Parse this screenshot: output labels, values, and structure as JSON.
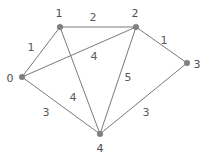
{
  "figure": {
    "name": "weighted-undirected-graph",
    "width": 207,
    "height": 155,
    "background_color": "#ffffff",
    "node_color": "#808080",
    "edge_color": "#7a7a7a",
    "label_color": "#5a5a5a"
  },
  "chart_data": {
    "type": "diagram",
    "subtype": "node-link-graph",
    "title": "",
    "directed": false,
    "weighted": true,
    "node_count": 5,
    "edge_count": 8,
    "nodes": [
      {
        "id": "0",
        "label": "0",
        "x": 22,
        "y": 77,
        "label_x": 10,
        "label_y": 78
      },
      {
        "id": "1",
        "label": "1",
        "x": 60,
        "y": 27,
        "label_x": 59,
        "label_y": 13
      },
      {
        "id": "2",
        "label": "2",
        "x": 136,
        "y": 27,
        "label_x": 135,
        "label_y": 13
      },
      {
        "id": "3",
        "label": "3",
        "x": 187,
        "y": 63,
        "label_x": 197,
        "label_y": 64
      },
      {
        "id": "4",
        "label": "4",
        "x": 100,
        "y": 134,
        "label_x": 100,
        "label_y": 148
      }
    ],
    "edges": [
      {
        "source": "0",
        "target": "1",
        "weight": "1",
        "label_x": 31,
        "label_y": 47
      },
      {
        "source": "1",
        "target": "2",
        "weight": "2",
        "label_x": 93,
        "label_y": 17
      },
      {
        "source": "0",
        "target": "2",
        "weight": "4",
        "label_x": 94,
        "label_y": 56
      },
      {
        "source": "2",
        "target": "3",
        "weight": "1",
        "label_x": 164,
        "label_y": 40
      },
      {
        "source": "0",
        "target": "4",
        "weight": "3",
        "label_x": 46,
        "label_y": 112
      },
      {
        "source": "1",
        "target": "4",
        "weight": "4",
        "label_x": 73,
        "label_y": 97
      },
      {
        "source": "2",
        "target": "4",
        "weight": "5",
        "label_x": 128,
        "label_y": 77
      },
      {
        "source": "3",
        "target": "4",
        "weight": "3",
        "label_x": 146,
        "label_y": 112
      }
    ]
  }
}
